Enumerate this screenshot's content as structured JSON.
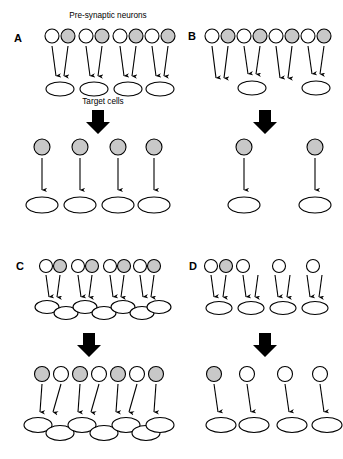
{
  "figure": {
    "title_annotation": "Pre-synaptic neurons",
    "target_annotation": "Target cells",
    "colors": {
      "shaded_neuron": "#c8c8c8",
      "unshaded_neuron": "#ffffff",
      "outline": "#000000",
      "arrow": "#000000",
      "background": "#ffffff"
    },
    "panels": [
      {
        "id": "A",
        "label": "A",
        "before": {
          "neuron_groups": [
            {
              "neurons": [
                "unshaded",
                "shaded"
              ],
              "target_count": 1
            },
            {
              "neurons": [
                "unshaded",
                "shaded"
              ],
              "target_count": 1
            },
            {
              "neurons": [
                "unshaded",
                "shaded"
              ],
              "target_count": 1
            },
            {
              "neurons": [
                "unshaded",
                "shaded"
              ],
              "target_count": 1
            }
          ],
          "target_cells": 4,
          "target_layout": "separated"
        },
        "after": {
          "neurons": [
            "shaded",
            "shaded",
            "shaded",
            "shaded"
          ],
          "target_cells": 4,
          "target_layout": "separated",
          "arrow_style": "vertical"
        }
      },
      {
        "id": "B",
        "label": "B",
        "before": {
          "neuron_groups": [
            {
              "neurons": [
                "unshaded",
                "shaded"
              ],
              "target_count": 0
            },
            {
              "neurons": [
                "unshaded",
                "shaded"
              ],
              "target_count": 1
            },
            {
              "neurons": [
                "unshaded",
                "shaded"
              ],
              "target_count": 0
            },
            {
              "neurons": [
                "unshaded",
                "shaded"
              ],
              "target_count": 1
            }
          ],
          "target_cells": 2,
          "target_layout": "separated"
        },
        "after": {
          "neurons": [
            "shaded",
            "shaded"
          ],
          "target_cells": 2,
          "target_layout": "separated",
          "arrow_style": "vertical"
        }
      },
      {
        "id": "C",
        "label": "C",
        "before": {
          "neuron_groups": [
            {
              "neurons": [
                "unshaded",
                "shaded"
              ],
              "target_count": 1
            },
            {
              "neurons": [
                "unshaded",
                "shaded"
              ],
              "target_count": 1
            },
            {
              "neurons": [
                "unshaded",
                "shaded"
              ],
              "target_count": 1
            },
            {
              "neurons": [
                "unshaded",
                "shaded"
              ],
              "target_count": 1
            }
          ],
          "target_cells": 7,
          "target_layout": "staggered-chain"
        },
        "after": {
          "neurons": [
            "shaded",
            "unshaded",
            "shaded",
            "unshaded",
            "shaded",
            "unshaded",
            "shaded"
          ],
          "target_cells": 7,
          "target_layout": "staggered-chain",
          "arrow_style": "slanted"
        }
      },
      {
        "id": "D",
        "label": "D",
        "before": {
          "neuron_groups": [
            {
              "neurons": [
                "unshaded",
                "shaded"
              ],
              "target_count": 1
            },
            {
              "neurons": [
                "unshaded"
              ],
              "target_count": 1
            },
            {
              "neurons": [],
              "target_count": 1
            },
            {
              "neurons": [
                "unshaded"
              ],
              "target_count": 1
            }
          ],
          "top_row_neurons": [
            "unshaded",
            "shaded",
            "unshaded",
            "unshaded",
            "unshaded"
          ],
          "target_cells": 4,
          "target_layout": "separated"
        },
        "after": {
          "neurons": [
            "shaded",
            "unshaded",
            "unshaded",
            "unshaded"
          ],
          "target_cells": 4,
          "target_layout": "separated",
          "arrow_style": "slanted"
        }
      }
    ],
    "transition_arrow": {
      "name": "block-arrow-down",
      "direction": "down",
      "count": 4
    }
  }
}
